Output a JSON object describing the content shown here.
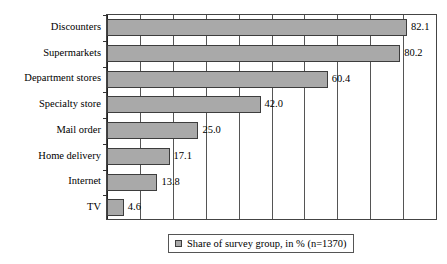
{
  "chart_data": {
    "type": "bar",
    "orientation": "horizontal",
    "title": "",
    "xlabel": "",
    "ylabel": "",
    "xlim": [
      0,
      90
    ],
    "grid": true,
    "gridline_count": 9,
    "legend_position": "bottom-center",
    "categories": [
      "Discounters",
      "Supermarkets",
      "Department stores",
      "Specialty store",
      "Mail order",
      "Home delivery",
      "Internet",
      "TV"
    ],
    "values": [
      82.1,
      80.2,
      60.4,
      42.0,
      25.0,
      17.1,
      13.8,
      4.6
    ],
    "value_labels": [
      "82.1",
      "80.2",
      "60.4",
      "42.0",
      "25.0",
      "17.1",
      "13.8",
      "4.6"
    ],
    "series": [
      {
        "name": "Share of survey group, in % (n=1370)",
        "values": [
          82.1,
          80.2,
          60.4,
          42.0,
          25.0,
          17.1,
          13.8,
          4.6
        ],
        "color": "#a9a9a9"
      }
    ]
  },
  "legend": {
    "marker": "square-swatch",
    "label": "Share of survey group, in % (n=1370)"
  },
  "colors": {
    "bar_fill": "#a9a9a9",
    "bar_border": "#3d3d3d",
    "gridline": "#555555",
    "plot_border": "#444444",
    "background": "#ffffff",
    "text": "#000000"
  }
}
